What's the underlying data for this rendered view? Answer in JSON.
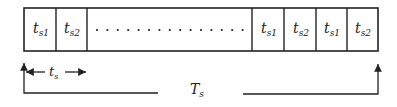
{
  "diagram": {
    "slots": [
      {
        "label": "t",
        "sub": "s1"
      },
      {
        "label": "t",
        "sub": "s2"
      },
      {
        "label": "",
        "sub": "",
        "ellipsis": true
      },
      {
        "label": "t",
        "sub": "s1"
      },
      {
        "label": "t",
        "sub": "s2"
      },
      {
        "label": "t",
        "sub": "s1"
      },
      {
        "label": "t",
        "sub": "s2"
      }
    ],
    "slot_span_label": {
      "main": "t",
      "sub": "s"
    },
    "period_label": {
      "main": "T",
      "sub": "s"
    },
    "colors": {
      "stroke": "#222222",
      "background": "#ffffff"
    }
  }
}
